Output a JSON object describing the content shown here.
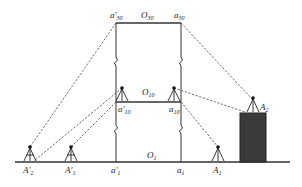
{
  "diagram": {
    "type": "surveying-setup",
    "labels": {
      "a30_prime": {
        "main": "a′",
        "sub": "30"
      },
      "O30": {
        "main": "O",
        "sub": "30"
      },
      "a30": {
        "main": "a",
        "sub": "30"
      },
      "O10": {
        "main": "O",
        "sub": "10"
      },
      "a10_prime": {
        "main": "a′",
        "sub": "10"
      },
      "a10": {
        "main": "a",
        "sub": "10"
      },
      "O1": {
        "main": "O",
        "sub": "1"
      },
      "A2_prime": {
        "main": "A′",
        "sub": "2"
      },
      "A1_prime": {
        "main": "A′",
        "sub": "1"
      },
      "a1_prime": {
        "main": "a′",
        "sub": "1"
      },
      "a1": {
        "main": "a",
        "sub": "1"
      },
      "A1": {
        "main": "A",
        "sub": "1"
      },
      "A2": {
        "main": "A",
        "sub": "2"
      }
    },
    "colors": {
      "line": "#333333",
      "building_fill": "#3a3a3a",
      "background": "#ffffff"
    }
  }
}
